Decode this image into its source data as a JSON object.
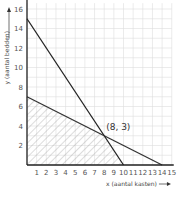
{
  "chart_data": {
    "type": "line",
    "title": "",
    "xlabel": "x (aantal kasten)",
    "ylabel": "y (aantal bedden)",
    "xlim": [
      0,
      15
    ],
    "ylim": [
      0,
      16
    ],
    "grid": true,
    "x_ticks": [
      1,
      2,
      3,
      4,
      5,
      6,
      7,
      8,
      9,
      10,
      11,
      12,
      13,
      14,
      15
    ],
    "y_ticks": [
      2,
      4,
      6,
      8,
      10,
      12,
      14,
      16
    ],
    "series": [
      {
        "name": "line-1",
        "points": [
          [
            0,
            15
          ],
          [
            10,
            0
          ]
        ],
        "color": "#222222"
      },
      {
        "name": "line-2",
        "points": [
          [
            0,
            7
          ],
          [
            14,
            0
          ]
        ],
        "color": "#333333"
      }
    ],
    "feasible_region": {
      "polygon": [
        [
          0,
          0
        ],
        [
          0,
          7
        ],
        [
          8,
          3
        ],
        [
          10,
          0
        ]
      ],
      "fill": "hatched"
    },
    "annotations": [
      {
        "text": "(8, 3)",
        "x": 8,
        "y": 3
      }
    ]
  },
  "labels": {
    "xlabel": "x (aantal kasten)",
    "ylabel": "y (aantal bedden)",
    "point": "(8, 3)"
  }
}
